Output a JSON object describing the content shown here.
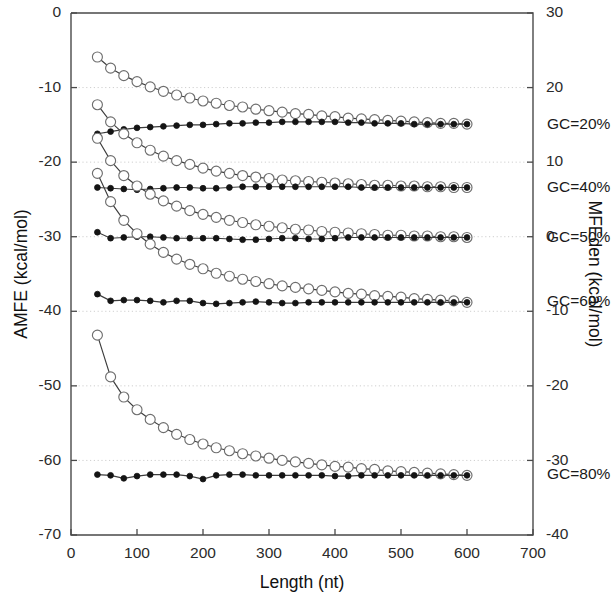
{
  "chart_data": {
    "type": "line",
    "title": "",
    "xlabel": "Length (nt)",
    "ylabel": "AMFE (kcal/mol)",
    "y2label": "MFEden (kcal/mol)",
    "xlim": [
      0,
      700
    ],
    "ylim": [
      -70,
      0
    ],
    "y2lim": [
      -40,
      30
    ],
    "xticks": [
      0,
      100,
      200,
      300,
      400,
      500,
      600,
      700
    ],
    "yticks": [
      0,
      -10,
      -20,
      -30,
      -40,
      -50,
      -60,
      -70
    ],
    "y2ticks": [
      30,
      20,
      10,
      0,
      -10,
      -20,
      -30,
      -40
    ],
    "grid": true,
    "legend_position": "inline-right",
    "marker_open_name": "open-circle",
    "marker_filled_name": "filled-circle",
    "x": [
      40,
      60,
      80,
      100,
      120,
      140,
      160,
      180,
      200,
      220,
      240,
      260,
      280,
      300,
      320,
      340,
      360,
      380,
      400,
      420,
      440,
      460,
      480,
      500,
      520,
      540,
      560,
      580,
      600
    ],
    "series": [
      {
        "name": "GC=20% AMFE",
        "label": "GC=20%",
        "marker": "open-circle",
        "values": [
          -5.9,
          -7.4,
          -8.4,
          -9.2,
          -9.9,
          -10.5,
          -11.0,
          -11.4,
          -11.8,
          -12.1,
          -12.4,
          -12.6,
          -12.9,
          -13.1,
          -13.3,
          -13.5,
          -13.6,
          -13.8,
          -13.9,
          -14.1,
          -14.2,
          -14.3,
          -14.4,
          -14.5,
          -14.6,
          -14.7,
          -14.8,
          -14.8,
          -14.9
        ]
      },
      {
        "name": "GC=20% MFEden",
        "label": "GC=20%",
        "marker": "filled-circle",
        "values": [
          -16.2,
          -15.9,
          -15.6,
          -15.4,
          -15.3,
          -15.2,
          -15.1,
          -15.0,
          -15.0,
          -14.9,
          -14.8,
          -14.8,
          -14.7,
          -14.7,
          -14.6,
          -14.6,
          -14.6,
          -14.6,
          -14.6,
          -14.7,
          -14.7,
          -14.8,
          -14.8,
          -14.8,
          -14.9,
          -14.9,
          -14.9,
          -14.9,
          -14.9
        ]
      },
      {
        "name": "GC=40% AMFE",
        "label": "GC=40%",
        "marker": "open-circle",
        "values": [
          -12.3,
          -14.6,
          -16.2,
          -17.4,
          -18.4,
          -19.2,
          -19.8,
          -20.3,
          -20.8,
          -21.2,
          -21.5,
          -21.8,
          -22.0,
          -22.2,
          -22.4,
          -22.5,
          -22.6,
          -22.7,
          -22.8,
          -22.9,
          -23.0,
          -23.1,
          -23.1,
          -23.2,
          -23.2,
          -23.3,
          -23.3,
          -23.4,
          -23.4
        ]
      },
      {
        "name": "GC=40% MFEden",
        "label": "GC=40%",
        "marker": "filled-circle",
        "values": [
          -23.4,
          -23.5,
          -23.6,
          -23.7,
          -23.6,
          -23.5,
          -23.4,
          -23.4,
          -23.5,
          -23.5,
          -23.4,
          -23.3,
          -23.3,
          -23.3,
          -23.3,
          -23.3,
          -23.3,
          -23.3,
          -23.3,
          -23.3,
          -23.4,
          -23.4,
          -23.4,
          -23.4,
          -23.4,
          -23.4,
          -23.4,
          -23.4,
          -23.4
        ]
      },
      {
        "name": "GC=50% AMFE",
        "label": "GC=50%",
        "marker": "open-circle",
        "values": [
          -16.8,
          -19.8,
          -21.8,
          -23.2,
          -24.3,
          -25.2,
          -25.9,
          -26.5,
          -27.0,
          -27.4,
          -27.8,
          -28.1,
          -28.4,
          -28.6,
          -28.8,
          -29.0,
          -29.1,
          -29.3,
          -29.4,
          -29.5,
          -29.6,
          -29.7,
          -29.8,
          -29.8,
          -29.9,
          -29.9,
          -30.0,
          -30.0,
          -30.1
        ]
      },
      {
        "name": "GC=50% MFEden",
        "label": "GC=50%",
        "marker": "filled-circle",
        "values": [
          -29.4,
          -30.2,
          -30.1,
          -30.0,
          -30.0,
          -30.1,
          -30.2,
          -30.2,
          -30.2,
          -30.2,
          -30.3,
          -30.4,
          -30.4,
          -30.3,
          -30.2,
          -30.2,
          -30.3,
          -30.3,
          -30.2,
          -30.1,
          -30.1,
          -30.1,
          -30.1,
          -30.1,
          -30.1,
          -30.1,
          -30.1,
          -30.1,
          -30.1
        ]
      },
      {
        "name": "GC=60% AMFE",
        "label": "GC=60%",
        "marker": "open-circle",
        "values": [
          -21.5,
          -25.3,
          -27.8,
          -29.6,
          -31.0,
          -32.1,
          -33.0,
          -33.7,
          -34.3,
          -34.9,
          -35.3,
          -35.7,
          -36.0,
          -36.3,
          -36.6,
          -36.8,
          -37.0,
          -37.2,
          -37.4,
          -37.6,
          -37.7,
          -37.9,
          -38.0,
          -38.1,
          -38.3,
          -38.4,
          -38.5,
          -38.6,
          -38.8
        ]
      },
      {
        "name": "GC=60% MFEden",
        "label": "GC=60%",
        "marker": "filled-circle",
        "values": [
          -37.7,
          -38.6,
          -38.5,
          -38.5,
          -38.6,
          -38.8,
          -38.6,
          -38.6,
          -38.9,
          -39.0,
          -38.9,
          -38.8,
          -38.7,
          -38.8,
          -38.9,
          -38.9,
          -38.8,
          -38.8,
          -38.8,
          -38.8,
          -38.8,
          -38.8,
          -38.8,
          -38.8,
          -38.8,
          -38.8,
          -38.8,
          -38.8,
          -38.8
        ]
      },
      {
        "name": "GC=80% AMFE",
        "label": "GC=80%",
        "marker": "open-circle",
        "values": [
          -43.2,
          -48.8,
          -51.5,
          -53.2,
          -54.5,
          -55.6,
          -56.5,
          -57.2,
          -57.8,
          -58.3,
          -58.7,
          -59.1,
          -59.4,
          -59.7,
          -60.0,
          -60.2,
          -60.4,
          -60.6,
          -60.8,
          -60.9,
          -61.1,
          -61.2,
          -61.4,
          -61.5,
          -61.6,
          -61.7,
          -61.8,
          -61.9,
          -62.0
        ]
      },
      {
        "name": "GC=80% MFEden",
        "label": "GC=80%",
        "marker": "filled-circle",
        "values": [
          -61.9,
          -62.0,
          -62.4,
          -62.1,
          -61.9,
          -61.9,
          -61.9,
          -62.1,
          -62.5,
          -62.0,
          -61.9,
          -61.9,
          -62.0,
          -62.0,
          -62.0,
          -62.0,
          -62.0,
          -62.0,
          -62.1,
          -62.1,
          -62.0,
          -62.0,
          -62.0,
          -62.0,
          -62.0,
          -62.0,
          -62.0,
          -62.0,
          -62.0
        ]
      }
    ],
    "annotations": [
      {
        "text": "GC=20%",
        "value": -15.0
      },
      {
        "text": "GC=40%",
        "value": -23.4
      },
      {
        "text": "GC=50%",
        "value": -30.1
      },
      {
        "text": "GC=60%",
        "value": -38.8
      },
      {
        "text": "GC=80%",
        "value": -62.0
      }
    ]
  }
}
